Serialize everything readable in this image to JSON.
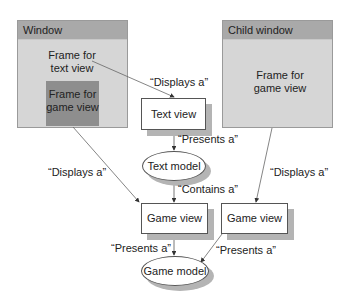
{
  "window": {
    "title": "Window",
    "frame_text_view": [
      "Frame for",
      "text view"
    ],
    "frame_game_view": [
      "Frame for",
      "game view"
    ]
  },
  "child_window": {
    "title": "Child window",
    "frame_game_view": [
      "Frame for",
      "game view"
    ]
  },
  "nodes": {
    "text_view": "Text view",
    "text_model": "Text model",
    "game_view_left": "Game view",
    "game_view_right": "Game view",
    "game_model": "Game model"
  },
  "edges": {
    "frame_text_to_text_view": "“Displays a”",
    "text_view_to_text_model": "“Presents a”",
    "frame_game_to_game_view_left": "“Displays a”",
    "text_model_to_game_view": "“Contains a”",
    "child_frame_to_game_view_right": "“Displays a”",
    "game_view_left_to_game_model": "“Presents a”",
    "game_view_right_to_game_model": "“Presents a”"
  },
  "colors": {
    "title_bar": "#a9a9a9",
    "window_bg": "#d6d6d6",
    "dark_frame": "#8e8e8e",
    "shadow": "#b4b4b4"
  }
}
